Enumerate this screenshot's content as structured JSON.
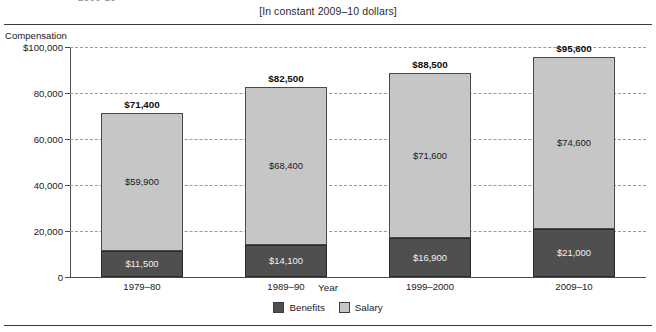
{
  "header": {
    "clipped_title_fragment": "2009-10",
    "subtitle": "[In constant 2009–10 dollars]"
  },
  "legend": {
    "position": "bottom-center",
    "items": [
      {
        "label": "Benefits",
        "color": "#4f4f4f"
      },
      {
        "label": "Salary",
        "color": "#c6c6c6"
      }
    ]
  },
  "chart_data": {
    "type": "bar",
    "stacked": true,
    "title": "",
    "subtitle": "[In constant 2009–10 dollars]",
    "xlabel": "Year",
    "ylabel": "Compensation",
    "ylim": [
      0,
      100000
    ],
    "grid": true,
    "categories": [
      "1979–80",
      "1989–90",
      "1999–2000",
      "2009–10"
    ],
    "ytick_labels": [
      "$100,000",
      "80,000",
      "60,000",
      "40,000",
      "20,000",
      "0"
    ],
    "ytick_values": [
      100000,
      80000,
      60000,
      40000,
      20000,
      0
    ],
    "series": [
      {
        "name": "Benefits",
        "color": "#4f4f4f",
        "values": [
          11500,
          14100,
          16900,
          21000
        ],
        "data_labels": [
          "$11,500",
          "$14,100",
          "$16,900",
          "$21,000"
        ]
      },
      {
        "name": "Salary",
        "color": "#c6c6c6",
        "values": [
          59900,
          68400,
          71600,
          74600
        ],
        "data_labels": [
          "$59,900",
          "$68,400",
          "$71,600",
          "$74,600"
        ]
      }
    ],
    "totals": [
      71400,
      82500,
      88500,
      95600
    ],
    "total_labels": [
      "$71,400",
      "$82,500",
      "$88,500",
      "$95,600"
    ]
  }
}
